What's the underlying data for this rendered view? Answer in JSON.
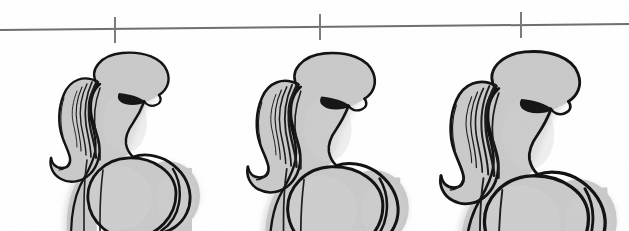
{
  "canvas": {
    "width": 629,
    "height": 231,
    "background_color": "#ffffff",
    "title": "Body shape progression illustration"
  },
  "palette": {
    "background": "#ffffff",
    "figure_fill": "#c9c9c9",
    "figure_fill_light": "#d6d6d6",
    "figure_fill_shadow": "#bdbdbd",
    "outline": "#111111",
    "hair_stroke": "#1a1a1a",
    "ruler_line": "#6e6e6e",
    "tick_mark": "#7a7a7a",
    "soft_edge": "#cfcfcf"
  },
  "ruler": {
    "name": "measurement-line",
    "left_x": 0,
    "right_x": 629,
    "left_y": 30,
    "right_y": 24,
    "stroke_width": 2,
    "color": "#6e6e6e",
    "ticks": [
      {
        "label": "",
        "x": 115,
        "top_y": 17,
        "bottom_y": 43
      },
      {
        "label": "",
        "x": 320,
        "top_y": 14,
        "bottom_y": 40
      },
      {
        "label": "",
        "x": 521,
        "top_y": 12,
        "bottom_y": 38
      }
    ]
  },
  "figures": [
    {
      "id": "figure-1",
      "label": "Figure 1",
      "order": 1,
      "scale": 1.0,
      "origin_x": 40,
      "origin_y": 48,
      "head_center_x": 100,
      "description": "Profile silhouette facing right with ponytail, smallest proportions",
      "hip_width": 92,
      "hip_height": 88,
      "cropped_at_bottom": true
    },
    {
      "id": "figure-2",
      "label": "Figure 2",
      "order": 2,
      "scale": 1.08,
      "origin_x": 236,
      "origin_y": 48,
      "head_center_x": 295,
      "description": "Profile silhouette facing right with ponytail, medium proportions",
      "hip_width": 104,
      "hip_height": 96,
      "cropped_at_bottom": true
    },
    {
      "id": "figure-3",
      "label": "Figure 3",
      "order": 3,
      "scale": 1.18,
      "origin_x": 428,
      "origin_y": 46,
      "head_center_x": 490,
      "description": "Profile silhouette facing right with ponytail, largest proportions",
      "hip_width": 120,
      "hip_height": 108,
      "cropped_at_bottom": true
    }
  ],
  "chart_data": {
    "type": "bar",
    "title": "Body shape progression",
    "xlabel": "",
    "ylabel": "Relative size",
    "categories": [
      "Figure 1",
      "Figure 2",
      "Figure 3"
    ],
    "values": [
      1.0,
      1.08,
      1.18
    ],
    "x": [
      115,
      320,
      521
    ],
    "grid": false,
    "legend_position": "none",
    "annotations": [
      "Three stylized female profile figures of increasing size beneath a horizontal reference line with three tick marks"
    ]
  }
}
